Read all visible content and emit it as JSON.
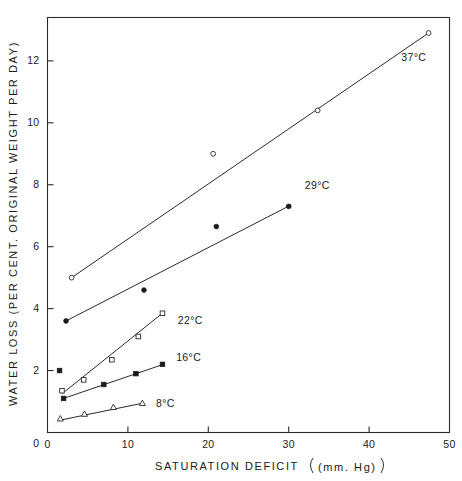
{
  "chart_data": {
    "type": "scatter",
    "title": "",
    "xlabel": "SATURATION DEFICIT  (mm. Hg)",
    "ylabel": "WATER LOSS (PER CENT. ORIGINAL WEIGHT PER DAY)",
    "xlim": [
      0,
      50
    ],
    "ylim": [
      0,
      13.4
    ],
    "xticks": [
      0,
      10,
      20,
      30,
      40,
      50
    ],
    "xticklabels": [
      "0",
      "10",
      "20",
      "30",
      "40",
      "50"
    ],
    "yticks": [
      2,
      4,
      6,
      8,
      10,
      12
    ],
    "yticklabels": [
      "2",
      "4",
      "6",
      "8",
      "10",
      "12"
    ],
    "grid": false,
    "legend": "inline-annotations",
    "series": [
      {
        "name": "37°C",
        "label": "37°C",
        "marker": "open-circle",
        "points": [
          {
            "x": 3.0,
            "y": 5.0
          },
          {
            "x": 20.6,
            "y": 9.0
          },
          {
            "x": 33.6,
            "y": 10.4
          },
          {
            "x": 47.4,
            "y": 12.9
          }
        ],
        "fit_line": [
          {
            "x": 3.0,
            "y": 5.0
          },
          {
            "x": 47.4,
            "y": 12.9
          }
        ],
        "label_x": 44.0,
        "label_y": 12.0
      },
      {
        "name": "29°C",
        "label": "29°C",
        "marker": "filled-circle",
        "points": [
          {
            "x": 2.3,
            "y": 3.6
          },
          {
            "x": 12.0,
            "y": 4.6
          },
          {
            "x": 21.0,
            "y": 6.65
          },
          {
            "x": 30.0,
            "y": 7.3
          }
        ],
        "fit_line": [
          {
            "x": 2.3,
            "y": 3.6
          },
          {
            "x": 30.3,
            "y": 7.35
          }
        ],
        "label_x": 32.0,
        "label_y": 7.85
      },
      {
        "name": "22°C",
        "label": "22°C",
        "marker": "open-square",
        "points": [
          {
            "x": 1.8,
            "y": 1.35
          },
          {
            "x": 4.5,
            "y": 1.7
          },
          {
            "x": 8.0,
            "y": 2.35
          },
          {
            "x": 11.3,
            "y": 3.1
          },
          {
            "x": 14.3,
            "y": 3.85
          }
        ],
        "fit_line": [
          {
            "x": 1.8,
            "y": 1.25
          },
          {
            "x": 14.3,
            "y": 3.85
          }
        ],
        "label_x": 16.2,
        "label_y": 3.5
      },
      {
        "name": "16°C",
        "label": "16°C",
        "marker": "filled-square",
        "points": [
          {
            "x": 1.5,
            "y": 2.0
          },
          {
            "x": 2.0,
            "y": 1.1
          },
          {
            "x": 7.0,
            "y": 1.55
          },
          {
            "x": 11.0,
            "y": 1.9
          },
          {
            "x": 14.3,
            "y": 2.2
          }
        ],
        "fit_line": [
          {
            "x": 2.0,
            "y": 1.1
          },
          {
            "x": 14.4,
            "y": 2.2
          }
        ],
        "label_x": 16.0,
        "label_y": 2.3
      },
      {
        "name": "8°C",
        "label": "8°C",
        "marker": "open-triangle",
        "points": [
          {
            "x": 1.6,
            "y": 0.45
          },
          {
            "x": 4.6,
            "y": 0.6
          },
          {
            "x": 8.2,
            "y": 0.82
          },
          {
            "x": 11.8,
            "y": 0.95
          }
        ],
        "fit_line": [
          {
            "x": 1.6,
            "y": 0.4
          },
          {
            "x": 11.9,
            "y": 0.95
          }
        ],
        "label_x": 13.5,
        "label_y": 0.82
      }
    ]
  },
  "axes": {
    "x_title": "SATURATION DEFICIT",
    "x_units": "(mm. Hg)",
    "y_title_line": "WATER LOSS (PER CENT. ORIGINAL WEIGHT PER DAY)"
  },
  "colors": {
    "ink": "#1a1a1a",
    "frame": "#2b2b2b",
    "background": "#ffffff"
  }
}
